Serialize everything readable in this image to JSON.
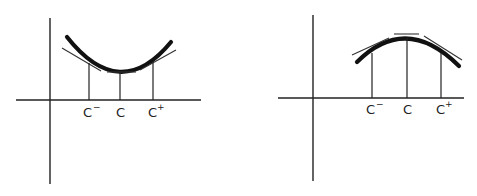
{
  "figures": [
    {
      "name": "convex",
      "description": "Concave-up curve with tangent lines at c-, c, c+",
      "labels": {
        "c_minus": "C",
        "c_minus_sup": "−",
        "c": "C",
        "c_plus": "C",
        "c_plus_sup": "+"
      }
    },
    {
      "name": "concave",
      "description": "Concave-down curve with tangent lines at c-, c, c+",
      "labels": {
        "c_minus": "C",
        "c_minus_sup": "−",
        "c": "C",
        "c_plus": "C",
        "c_plus_sup": "+"
      }
    }
  ],
  "colors": {
    "ink": "#111111",
    "background": "#ffffff"
  }
}
